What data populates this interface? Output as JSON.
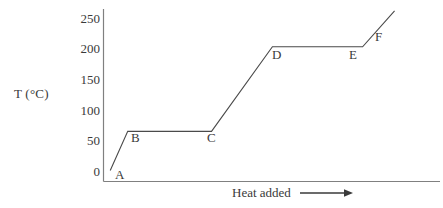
{
  "chart_data": {
    "type": "line",
    "title": "",
    "subtitle": "",
    "xlabel": "Heat added",
    "ylabel": "T (°C)",
    "ylabel_symbol": "T",
    "ylabel_unit": "(°C)",
    "xlabel_arrow": "⟶",
    "grid": false,
    "legend": null,
    "ylim": [
      0,
      265
    ],
    "yticks": [
      0,
      50,
      100,
      150,
      200,
      250
    ],
    "ytick_labels": [
      "0",
      "50",
      "100",
      "150",
      "200",
      "250"
    ],
    "xlim": [
      0,
      100
    ],
    "xticks": [],
    "xtick_labels": [],
    "x_axis_arrow": true,
    "line_color": "#4a4a4a",
    "axis_color": "#808080",
    "text_color": "#3a3a3a",
    "background_color": "#ffffff",
    "series": [
      {
        "name": "heating curve",
        "x": [
          2.0,
          7.2,
          32.1,
          50.2,
          77.0,
          86.5
        ],
        "y": [
          17,
          77,
          77,
          207,
          207,
          262
        ],
        "points": [
          {
            "label": "A",
            "x": 2.0,
            "y": 17
          },
          {
            "label": "B",
            "x": 7.2,
            "y": 77
          },
          {
            "label": "C",
            "x": 32.1,
            "y": 77
          },
          {
            "label": "D",
            "x": 50.2,
            "y": 207
          },
          {
            "label": "E",
            "x": 77.0,
            "y": 207
          },
          {
            "label": "F",
            "x": 86.5,
            "y": 262
          }
        ]
      }
    ],
    "annotations": [
      {
        "text": "A",
        "x": 115,
        "y": 168
      },
      {
        "text": "B",
        "x": 131,
        "y": 131
      },
      {
        "text": "C",
        "x": 207,
        "y": 131
      },
      {
        "text": "D",
        "x": 272,
        "y": 48
      },
      {
        "text": "E",
        "x": 349,
        "y": 48
      },
      {
        "text": "F",
        "x": 375,
        "y": 30
      }
    ]
  }
}
